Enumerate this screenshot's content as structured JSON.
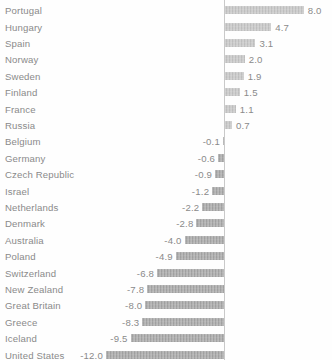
{
  "chart_data": {
    "type": "bar",
    "orientation": "horizontal",
    "title": "",
    "subtitle": "",
    "xlabel": "",
    "ylabel": "",
    "grid": false,
    "legend": null,
    "axis": {
      "zero_line": true,
      "xlim": [
        -12.0,
        8.0
      ]
    },
    "categories": [
      "Portugal",
      "Hungary",
      "Spain",
      "Norway",
      "Sweden",
      "Finland",
      "France",
      "Russia",
      "Belgium",
      "Germany",
      "Czech Republic",
      "Israel",
      "Netherlands",
      "Denmark",
      "Australia",
      "Poland",
      "Switzerland",
      "New Zealand",
      "Great Britain",
      "Greece",
      "Iceland",
      "United States"
    ],
    "values": [
      8.0,
      4.7,
      3.1,
      2.0,
      1.9,
      1.5,
      1.1,
      0.7,
      -0.1,
      -0.6,
      -0.9,
      -1.2,
      -2.2,
      -2.8,
      -4.0,
      -4.9,
      -6.8,
      -7.8,
      -8.0,
      -8.3,
      -9.5,
      -12.0
    ],
    "value_labels": [
      "8.0",
      "4.7",
      "3.1",
      "2.0",
      "1.9",
      "1.5",
      "1.1",
      "0.7",
      "-0.1",
      "-0.6",
      "-0.9",
      "-1.2",
      "-2.2",
      "-2.8",
      "-4.0",
      "-4.9",
      "-6.8",
      "-7.8",
      "-8.0",
      "-8.3",
      "-9.5",
      "-12.0"
    ],
    "colors": {
      "positive_bar": "#c3c3c3",
      "negative_bar": "#a6a6a6",
      "axis_line": "#c9c9c9",
      "text": "#8a8a8a",
      "background": "#fefefe"
    }
  }
}
